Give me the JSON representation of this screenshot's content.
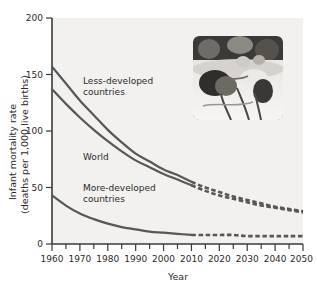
{
  "figure": {
    "background_color": "#ffffff",
    "plot_background_color": "#f2f1ef",
    "line_color": "#575757",
    "axis_color": "#3a3a3a",
    "text_color": "#2b2b2b"
  },
  "axes": {
    "xlabel": "Year",
    "ylabel_line1": "Infant mortality rate",
    "ylabel_line2": "(deaths per 1,000 live births)",
    "x_ticks": [
      "1960",
      "1970",
      "1980",
      "1990",
      "2000",
      "2010",
      "2020",
      "2030",
      "2040",
      "2050"
    ],
    "y_ticks": [
      "0",
      "50",
      "100",
      "150",
      "200"
    ],
    "xlim": [
      1960,
      2050
    ],
    "ylim": [
      0,
      200
    ],
    "x_minor_tick_interval": 5,
    "grid": false
  },
  "annotations": {
    "less_developed_line1": "Less-developed",
    "less_developed_line2": "countries",
    "world": "World",
    "more_developed_line1": "More-developed",
    "more_developed_line2": "countries"
  },
  "inset": {
    "name": "neonatal-infant-photo",
    "description": "Photograph of an infant in neonatal intensive care with tubes and wires",
    "x": 193,
    "y": 36,
    "width": 90,
    "height": 84
  },
  "chart_data": {
    "type": "line",
    "title": "",
    "xlabel": "Year",
    "ylabel": "Infant mortality rate (deaths per 1,000 live births)",
    "xlim": [
      1960,
      2050
    ],
    "ylim": [
      0,
      200
    ],
    "grid": false,
    "legend": "inline-labels",
    "projection_starts_at": 2010,
    "x": [
      1960,
      1965,
      1970,
      1975,
      1980,
      1985,
      1990,
      1995,
      2000,
      2005,
      2010,
      2015,
      2020,
      2025,
      2030,
      2035,
      2040,
      2045,
      2050
    ],
    "series": [
      {
        "name": "Less-developed countries",
        "label_text": "Less-developed countries",
        "style": "solid-then-dashed",
        "values": [
          157,
          142,
          127,
          114,
          101,
          90,
          80,
          73,
          66,
          61,
          55,
          50,
          46,
          42,
          39,
          36,
          33,
          31,
          29
        ]
      },
      {
        "name": "World",
        "label_text": "World",
        "style": "solid-then-dashed",
        "values": [
          137,
          124,
          112,
          101,
          91,
          82,
          74,
          68,
          62,
          57,
          52,
          47,
          43,
          40,
          37,
          34,
          32,
          30,
          28
        ]
      },
      {
        "name": "More-developed countries",
        "label_text": "More-developed countries",
        "style": "solid-then-dashed",
        "values": [
          43,
          34,
          27,
          22,
          18,
          15,
          13,
          11,
          10,
          9,
          8,
          8,
          8,
          8,
          7,
          7,
          7,
          7,
          7
        ]
      }
    ]
  }
}
